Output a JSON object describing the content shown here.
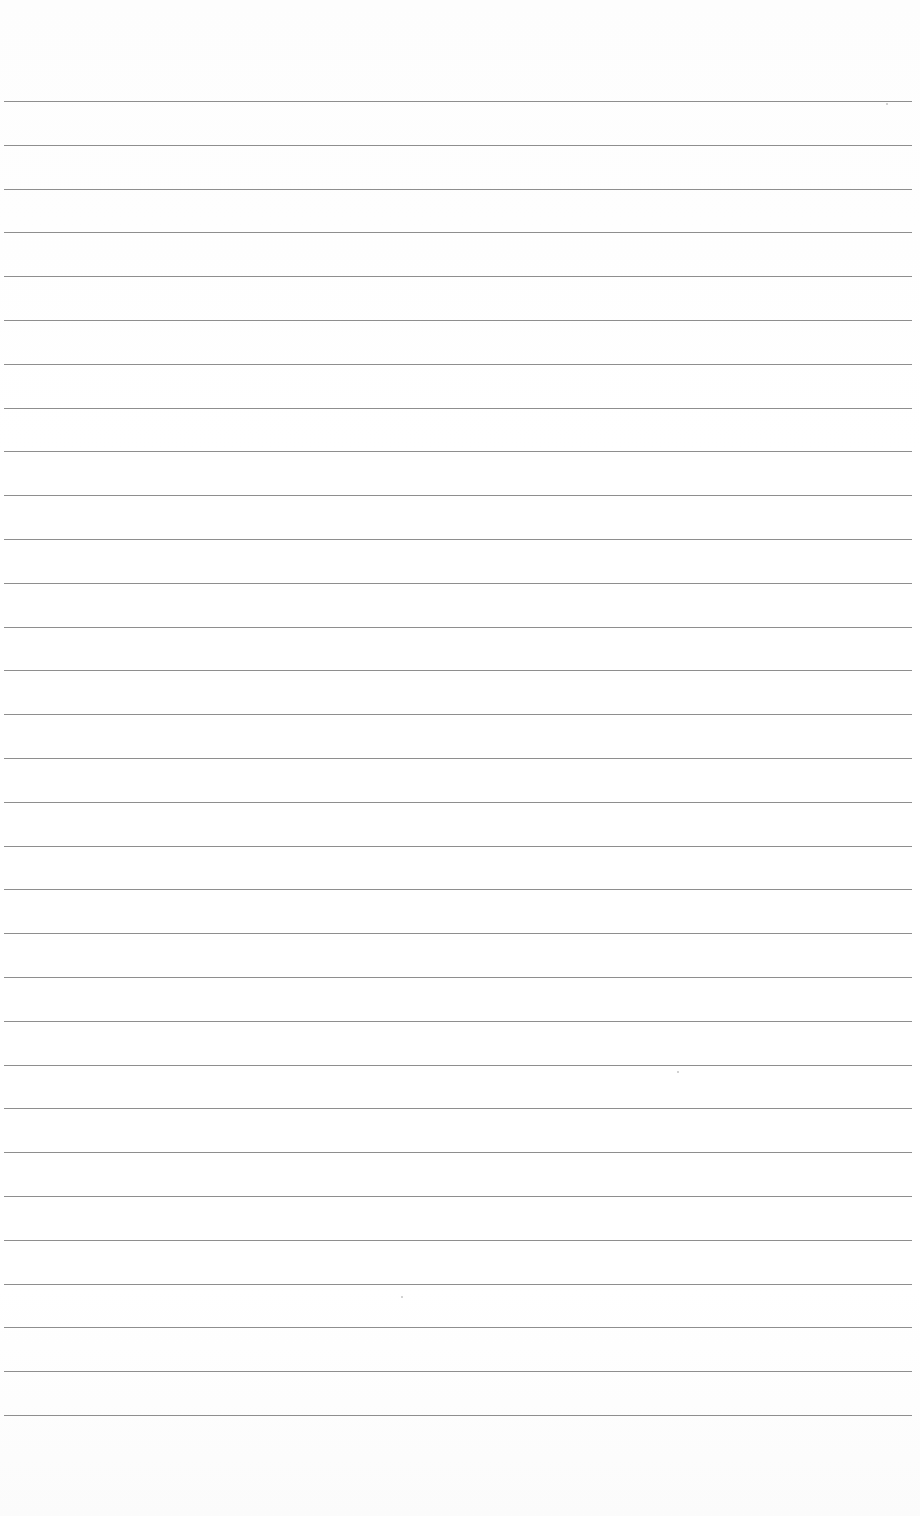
{
  "page": {
    "type": "lined-paper",
    "width": 920,
    "height": 1516,
    "background": "#ffffff",
    "rule_color": "#8e8e8e",
    "first_rule_y": 101,
    "rule_spacing": 43.8,
    "rule_count": 31,
    "rule_left": 4,
    "rule_right": 912
  },
  "specks": [
    {
      "x": 886,
      "y": 103
    },
    {
      "x": 677,
      "y": 1071
    },
    {
      "x": 401,
      "y": 1296
    }
  ]
}
